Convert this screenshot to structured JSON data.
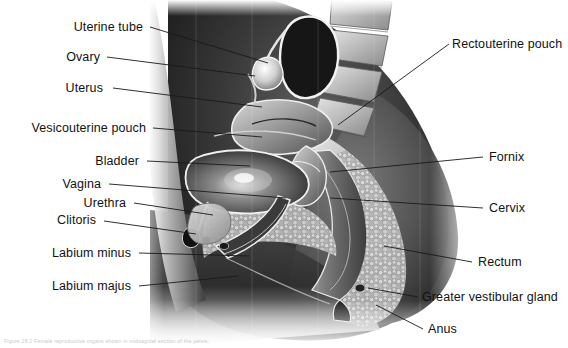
{
  "figure": {
    "view": "sagittal-section",
    "style": "grayscale-anatomical-illustration"
  },
  "labels_left": [
    {
      "id": "uterine-tube",
      "text": "Uterine tube",
      "text_x": 143,
      "text_y": 29,
      "line": {
        "x1": 150,
        "y1": 27,
        "x2": 268,
        "y2": 63
      }
    },
    {
      "id": "ovary",
      "text": "Ovary",
      "text_x": 100,
      "text_y": 59,
      "line": {
        "x1": 107,
        "y1": 57,
        "x2": 255,
        "y2": 76
      }
    },
    {
      "id": "uterus",
      "text": "Uterus",
      "text_x": 103,
      "text_y": 90,
      "line": {
        "x1": 113,
        "y1": 88,
        "x2": 262,
        "y2": 107
      }
    },
    {
      "id": "vesicouterine-pouch",
      "text": "Vesicouterine pouch",
      "text_x": 146,
      "text_y": 130,
      "line": {
        "x1": 153,
        "y1": 128,
        "x2": 262,
        "y2": 137
      }
    },
    {
      "id": "bladder",
      "text": "Bladder",
      "text_x": 139,
      "text_y": 163,
      "line": {
        "x1": 147,
        "y1": 161,
        "x2": 250,
        "y2": 166
      }
    },
    {
      "id": "vagina",
      "text": "Vagina",
      "text_x": 101,
      "text_y": 186,
      "line": {
        "x1": 109,
        "y1": 184,
        "x2": 286,
        "y2": 198
      }
    },
    {
      "id": "urethra",
      "text": "Urethra",
      "text_x": 126,
      "text_y": 205,
      "line": {
        "x1": 134,
        "y1": 203,
        "x2": 213,
        "y2": 215
      }
    },
    {
      "id": "clitoris",
      "text": "Clitoris",
      "text_x": 96,
      "text_y": 222,
      "line": {
        "x1": 104,
        "y1": 221,
        "x2": 196,
        "y2": 234
      }
    },
    {
      "id": "labium-minus",
      "text": "Labium minus",
      "text_x": 131,
      "text_y": 255,
      "line": {
        "x1": 139,
        "y1": 253,
        "x2": 249,
        "y2": 256
      }
    },
    {
      "id": "labium-majus",
      "text": "Labium majus",
      "text_x": 131,
      "text_y": 288,
      "line": {
        "x1": 139,
        "y1": 286,
        "x2": 238,
        "y2": 276
      }
    }
  ],
  "labels_right": [
    {
      "id": "rectouterine-pouch",
      "text": "Rectouterine pouch",
      "text_x": 452,
      "text_y": 46,
      "line": {
        "x1": 449,
        "y1": 44,
        "x2": 338,
        "y2": 125
      }
    },
    {
      "id": "fornix",
      "text": "Fornix",
      "text_x": 489,
      "text_y": 159,
      "line": {
        "x1": 483,
        "y1": 157,
        "x2": 330,
        "y2": 172
      }
    },
    {
      "id": "cervix",
      "text": "Cervix",
      "text_x": 489,
      "text_y": 210,
      "line": {
        "x1": 483,
        "y1": 208,
        "x2": 330,
        "y2": 198
      }
    },
    {
      "id": "rectum",
      "text": "Rectum",
      "text_x": 478,
      "text_y": 264,
      "line": {
        "x1": 472,
        "y1": 262,
        "x2": 384,
        "y2": 246
      }
    },
    {
      "id": "greater-vestibular-gland",
      "text": "Greater vestibular gland",
      "text_x": 422,
      "text_y": 299,
      "line": {
        "x1": 418,
        "y1": 297,
        "x2": 368,
        "y2": 288
      }
    },
    {
      "id": "anus",
      "text": "Anus",
      "text_x": 428,
      "text_y": 331,
      "line": {
        "x1": 423,
        "y1": 329,
        "x2": 376,
        "y2": 305
      }
    }
  ],
  "caption": {
    "text": "Figure 28.2  Female reproductive organs shown in midsagittal section of the pelvis."
  },
  "colors": {
    "background": "#ffffff",
    "label_text": "#121212",
    "leader_line": "#1a1a1a",
    "caption_text": "#c9c9c9"
  }
}
